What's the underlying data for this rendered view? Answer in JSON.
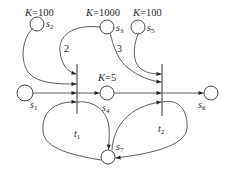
{
  "diagram": {
    "type": "petri-net",
    "places": [
      {
        "id": "s1",
        "name": "s",
        "sub": "1",
        "capacity": null
      },
      {
        "id": "s2",
        "name": "s",
        "sub": "2",
        "capacity": "K=100"
      },
      {
        "id": "s3",
        "name": "s",
        "sub": "3",
        "capacity": "K=1000"
      },
      {
        "id": "s4",
        "name": "s",
        "sub": "4",
        "capacity": "K=5"
      },
      {
        "id": "s5",
        "name": "s",
        "sub": "5",
        "capacity": "K=100"
      },
      {
        "id": "s6",
        "name": "s",
        "sub": "6",
        "capacity": null
      },
      {
        "id": "s7",
        "name": "s",
        "sub": "7",
        "capacity": null
      }
    ],
    "capacity_labels": {
      "s2": {
        "k": "K",
        "val": "=100"
      },
      "s3": {
        "k": "K",
        "val": "=1000"
      },
      "s4": {
        "k": "K",
        "val": "=5"
      },
      "s5": {
        "k": "K",
        "val": "=100"
      }
    },
    "transitions": [
      {
        "id": "t1",
        "name": "t",
        "sub": "1"
      },
      {
        "id": "t2",
        "name": "t",
        "sub": "2"
      }
    ],
    "arcs": [
      {
        "from": "s1",
        "to": "t1",
        "weight": null
      },
      {
        "from": "s2",
        "to": "t1",
        "weight": null
      },
      {
        "from": "s3",
        "to": "t1",
        "weight": "2"
      },
      {
        "from": "s7",
        "to": "t1",
        "weight": null
      },
      {
        "from": "t1",
        "to": "s4",
        "weight": null
      },
      {
        "from": "t1",
        "to": "s7",
        "weight": null
      },
      {
        "from": "s3",
        "to": "t2",
        "weight": "3"
      },
      {
        "from": "s5",
        "to": "t2",
        "weight": null
      },
      {
        "from": "s4",
        "to": "t2",
        "weight": null
      },
      {
        "from": "s7",
        "to": "t2",
        "weight": null
      },
      {
        "from": "t2",
        "to": "s6",
        "weight": null
      },
      {
        "from": "t2",
        "to": "s7",
        "weight": null
      }
    ],
    "weight_labels": {
      "s3_t1": "2",
      "s3_t2": "3"
    }
  }
}
